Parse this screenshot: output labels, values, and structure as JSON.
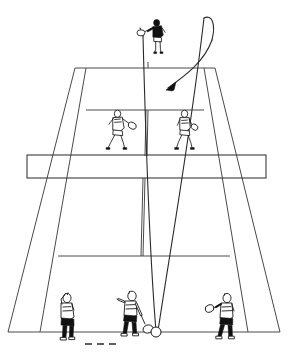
{
  "diagram": {
    "title": "Tennis doubles lob diagram",
    "description": "Perspective view of a doubles tennis court with six players and a lob ball trajectory arcing from the near baseline over the net players to the far baseline.",
    "surface_color": "#ffffff",
    "line_color": "#4a4a4a",
    "figure_color": "#1a1a1a",
    "width": 289,
    "height": 362
  },
  "court": {
    "name": "tennis-court",
    "view": "one-point-perspective-from-behind-near-baseline",
    "far_baseline_label": "far baseline",
    "near_baseline_label": "near baseline",
    "far_service_line_label": "far service line",
    "near_service_line_label": "near service line",
    "center_service_line_label": "center service line",
    "left_doubles_sideline_label": "left doubles sideline",
    "right_doubles_sideline_label": "right doubles sideline",
    "left_singles_sideline_label": "left singles sideline",
    "right_singles_sideline_label": "right singles sideline",
    "left_alley_label": "left doubles alley",
    "right_alley_label": "right doubles alley"
  },
  "net": {
    "name": "net",
    "label": "net",
    "top_y": 155,
    "bottom_y": 178,
    "left_x": 27,
    "right_x": 266
  },
  "trajectory": {
    "name": "lob-trajectory",
    "label": "lob ball flight path",
    "type": "lob",
    "origin": "near baseline center player racket",
    "apex_label": "apex",
    "landing_label": "landing point near far baseline",
    "arrow_direction": "down-left",
    "bounce_dash_label": "ground bounce line"
  },
  "ball": {
    "name": "tennis-ball",
    "label": "ball at contact"
  },
  "players": [
    {
      "id": "far-baseline-player",
      "label": "Far baseline player",
      "position": "far baseline, center",
      "shirt": "dark",
      "has_racket": true,
      "action": "tracking the lob"
    },
    {
      "id": "far-net-player-left",
      "label": "Far net player (left)",
      "position": "far court, left service box",
      "shirt": "light",
      "has_racket": true,
      "action": "ready stance at net"
    },
    {
      "id": "far-net-player-right",
      "label": "Far net player (right)",
      "position": "far court, right service box",
      "shirt": "light",
      "has_racket": true,
      "action": "ready stance at net"
    },
    {
      "id": "near-player-left",
      "label": "Near player (left)",
      "position": "near baseline, left",
      "shirt": "light",
      "has_racket": true,
      "action": "moving across"
    },
    {
      "id": "near-player-center",
      "label": "Near player (center, hitter)",
      "position": "near baseline, center",
      "shirt": "light",
      "has_racket": true,
      "action": "striking the lob"
    },
    {
      "id": "near-player-right",
      "label": "Near player (right)",
      "position": "near baseline, right",
      "shirt": "light",
      "has_racket": true,
      "action": "ready stance"
    }
  ]
}
